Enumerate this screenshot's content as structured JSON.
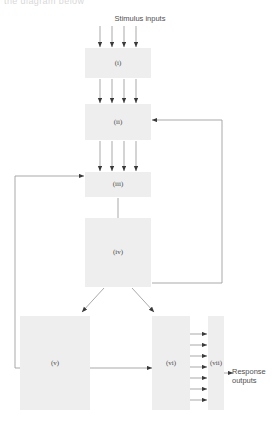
{
  "figure": {
    "clipped_header_text": "the diagram below",
    "stimulus_label": "Stimulus inputs",
    "response_label": "Response\noutputs",
    "colors": {
      "box_fill": "#eeeeee",
      "line": "#8d8d8d",
      "label_text": "#4a4a4a",
      "background": "#ffffff"
    }
  },
  "nodes": [
    {
      "id": "i",
      "label": "(i)",
      "x": 85,
      "y": 48,
      "w": 66,
      "h": 30
    },
    {
      "id": "ii",
      "label": "(ii)",
      "x": 85,
      "y": 104,
      "w": 66,
      "h": 36
    },
    {
      "id": "iii",
      "label": "(iii)",
      "x": 85,
      "y": 172,
      "w": 66,
      "h": 25
    },
    {
      "id": "iv",
      "label": "(iv)",
      "x": 85,
      "y": 218,
      "w": 66,
      "h": 69
    },
    {
      "id": "v",
      "label": "(v)",
      "x": 20,
      "y": 316,
      "w": 70,
      "h": 94
    },
    {
      "id": "vi",
      "label": "(vi)",
      "x": 152,
      "y": 316,
      "w": 38,
      "h": 94
    },
    {
      "id": "vii",
      "label": "(vii)",
      "x": 208,
      "y": 316,
      "w": 16,
      "h": 94
    }
  ],
  "edges": {
    "stimulus_to_i": {
      "count": 4,
      "from": "Stimulus inputs",
      "to": "(i)"
    },
    "i_to_ii": {
      "count": 4,
      "from": "(i)",
      "to": "(ii)"
    },
    "ii_to_iii": {
      "count": 4,
      "from": "(ii)",
      "to": "(iii)"
    },
    "iii_to_iv": {
      "count": 1,
      "from": "(iii)",
      "to": "(iv)"
    },
    "iv_to_v": {
      "count": 1,
      "from": "(iv)",
      "to": "(v)"
    },
    "iv_to_vi": {
      "count": 1,
      "from": "(iv)",
      "to": "(vi)"
    },
    "v_to_vi": {
      "count": 1,
      "from": "(v)",
      "to": "(vi)"
    },
    "vi_to_vii": {
      "count": 7,
      "from": "(vi)",
      "to": "(vii)"
    },
    "vii_to_output": {
      "count": 1,
      "from": "(vii)",
      "to": "Response outputs"
    },
    "feedback_left": {
      "count": 1,
      "from": "(v)",
      "to": "(iii)"
    },
    "feedback_right": {
      "count": 1,
      "from": "(iv)",
      "to": "(ii)"
    }
  }
}
